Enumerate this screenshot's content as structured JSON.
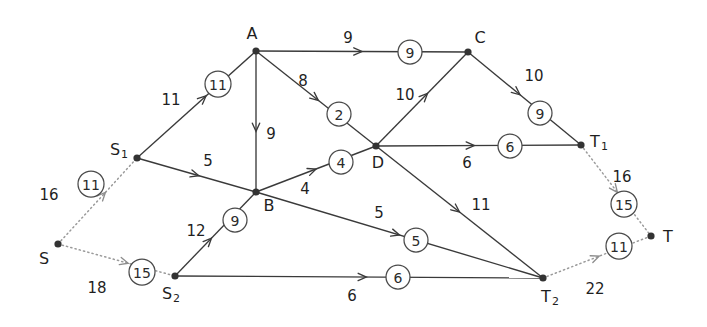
{
  "diagram": {
    "type": "network-flow-graph",
    "title": "",
    "style": {
      "edge_color": "#3a3a3a",
      "dotted_edge_color": "#9a9a9a",
      "node_color": "#333333",
      "capacity_circle_fill": "#ffffff",
      "background": "#ffffff"
    },
    "nodes": [
      {
        "id": "S",
        "label": "S",
        "sub": "",
        "x": 58,
        "y": 244,
        "label_dx": -14,
        "label_dy": 14,
        "dotted": true
      },
      {
        "id": "S1",
        "label": "S",
        "sub": "1",
        "x": 137,
        "y": 158,
        "label_dx": -18,
        "label_dy": -9,
        "dotted": false
      },
      {
        "id": "S2",
        "label": "S",
        "sub": "2",
        "x": 175,
        "y": 276,
        "label_dx": -4,
        "label_dy": 17,
        "dotted": false
      },
      {
        "id": "A",
        "label": "A",
        "sub": "",
        "x": 256,
        "y": 51,
        "label_dx": -4,
        "label_dy": -18,
        "dotted": false
      },
      {
        "id": "B",
        "label": "B",
        "sub": "",
        "x": 256,
        "y": 192,
        "label_dx": 13,
        "label_dy": 13,
        "dotted": false
      },
      {
        "id": "C",
        "label": "C",
        "sub": "",
        "x": 468,
        "y": 52,
        "label_dx": 12,
        "label_dy": -15,
        "dotted": false
      },
      {
        "id": "D",
        "label": "D",
        "sub": "",
        "x": 376,
        "y": 146,
        "label_dx": 2,
        "label_dy": 16,
        "dotted": false
      },
      {
        "id": "T1",
        "label": "T",
        "sub": "1",
        "x": 581,
        "y": 145,
        "label_dx": 18,
        "label_dy": -4,
        "dotted": false
      },
      {
        "id": "T2",
        "label": "T",
        "sub": "2",
        "x": 543,
        "y": 278,
        "label_dx": 7,
        "label_dy": 18,
        "dotted": false
      },
      {
        "id": "T",
        "label": "T",
        "sub": "",
        "x": 651,
        "y": 236,
        "label_dx": 17,
        "label_dy": 0,
        "dotted": true
      }
    ],
    "edges": [
      {
        "id": "S-S1",
        "from": "S",
        "to": "S1",
        "cost": "16",
        "capacity": "11",
        "dotted": true,
        "cost_x": 49,
        "cost_y": 195,
        "cap_x": 91,
        "cap_y": 184,
        "arrow_t": 0.6
      },
      {
        "id": "S-S2",
        "from": "S",
        "to": "S2",
        "cost": "18",
        "capacity": "15",
        "dotted": true,
        "cost_x": 97,
        "cost_y": 288,
        "cap_x": 142,
        "cap_y": 272,
        "arrow_t": 0.6
      },
      {
        "id": "S1-A",
        "from": "S1",
        "to": "A",
        "cost": "11",
        "capacity": "11",
        "dotted": false,
        "cost_x": 171,
        "cost_y": 100,
        "cap_x": 218,
        "cap_y": 84,
        "arrow_t": 0.58
      },
      {
        "id": "S1-B",
        "from": "S1",
        "to": "B",
        "cost": "5",
        "capacity": "",
        "dotted": false,
        "cost_x": 208,
        "cost_y": 161,
        "cap_x": 0,
        "cap_y": 0,
        "arrow_t": 0.52
      },
      {
        "id": "S2-B",
        "from": "S2",
        "to": "B",
        "cost": "12",
        "capacity": "9",
        "dotted": false,
        "cost_x": 196,
        "cost_y": 231,
        "cap_x": 235,
        "cap_y": 220,
        "arrow_t": 0.45
      },
      {
        "id": "A-C",
        "from": "A",
        "to": "C",
        "cost": "9",
        "capacity": "9",
        "dotted": false,
        "cost_x": 348,
        "cost_y": 38,
        "cap_x": 410,
        "cap_y": 52,
        "arrow_t": 0.5
      },
      {
        "id": "A-D",
        "from": "A",
        "to": "D",
        "cost": "8",
        "capacity": "2",
        "dotted": false,
        "cost_x": 303,
        "cost_y": 81,
        "cap_x": 339,
        "cap_y": 114,
        "arrow_t": 0.52
      },
      {
        "id": "A-B",
        "from": "A",
        "to": "B",
        "cost": "9",
        "capacity": "",
        "dotted": false,
        "cost_x": 271,
        "cost_y": 134,
        "cap_x": 0,
        "cap_y": 0,
        "arrow_t": 0.57
      },
      {
        "id": "B-D",
        "from": "B",
        "to": "D",
        "cost": "4",
        "capacity": "4",
        "dotted": false,
        "cost_x": 305,
        "cost_y": 189,
        "cap_x": 341,
        "cap_y": 162,
        "arrow_t": 0.5
      },
      {
        "id": "B-T2",
        "from": "B",
        "to": "T2",
        "cost": "5",
        "capacity": "5",
        "dotted": false,
        "cost_x": 379,
        "cost_y": 213,
        "cap_x": 416,
        "cap_y": 240,
        "arrow_t": 0.5
      },
      {
        "id": "D-C",
        "from": "D",
        "to": "C",
        "cost": "10",
        "capacity": "",
        "dotted": false,
        "cost_x": 405,
        "cost_y": 95,
        "cap_x": 0,
        "cap_y": 0,
        "arrow_t": 0.56
      },
      {
        "id": "C-T1",
        "from": "C",
        "to": "T1",
        "cost": "10",
        "capacity": "9",
        "dotted": false,
        "cost_x": 534,
        "cost_y": 76,
        "cap_x": 540,
        "cap_y": 113,
        "arrow_t": 0.46
      },
      {
        "id": "D-T1",
        "from": "D",
        "to": "T1",
        "cost": "6",
        "capacity": "6",
        "dotted": false,
        "cost_x": 467,
        "cost_y": 163,
        "cap_x": 510,
        "cap_y": 146,
        "arrow_t": 0.48
      },
      {
        "id": "D-T2",
        "from": "D",
        "to": "T2",
        "cost": "11",
        "capacity": "",
        "dotted": false,
        "cost_x": 481,
        "cost_y": 205,
        "cap_x": 0,
        "cap_y": 0,
        "arrow_t": 0.5
      },
      {
        "id": "S2-T2",
        "from": "S2",
        "to": "T2",
        "cost": "6",
        "capacity": "6",
        "dotted": false,
        "cost_x": 352,
        "cost_y": 296,
        "cap_x": 398,
        "cap_y": 277,
        "arrow_t": 0.52
      },
      {
        "id": "T1-T",
        "from": "T1",
        "to": "T",
        "cost": "16",
        "capacity": "15",
        "dotted": true,
        "cost_x": 622,
        "cost_y": 177,
        "cap_x": 624,
        "cap_y": 204,
        "arrow_t": 0.52
      },
      {
        "id": "T2-T",
        "from": "T2",
        "to": "T",
        "cost": "22",
        "capacity": "11",
        "dotted": true,
        "cost_x": 595,
        "cost_y": 289,
        "cap_x": 619,
        "cap_y": 246,
        "arrow_t": 0.52
      }
    ]
  }
}
